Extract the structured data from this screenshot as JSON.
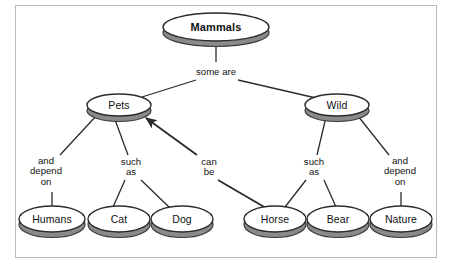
{
  "diagram": {
    "type": "concept-map",
    "colors": {
      "node_fill": "#ffffff",
      "node_stroke": "#2b2b2b",
      "node_shadow": "#8a8a8a",
      "edge_stroke": "#2b2b2b",
      "frame_border": "#b9b9b9",
      "background": "#ffffff"
    },
    "nodes": [
      {
        "id": "mammals",
        "label": "Mammals",
        "cx": 216,
        "cy": 27,
        "rx": 53,
        "ry": 14,
        "bold": true
      },
      {
        "id": "pets",
        "label": "Pets",
        "cx": 119,
        "cy": 105,
        "rx": 32,
        "ry": 11,
        "bold": false
      },
      {
        "id": "wild",
        "label": "Wild",
        "cx": 337,
        "cy": 105,
        "rx": 32,
        "ry": 11,
        "bold": false
      },
      {
        "id": "humans",
        "label": "Humans",
        "cx": 52,
        "cy": 219,
        "rx": 33,
        "ry": 13,
        "bold": false
      },
      {
        "id": "cat",
        "label": "Cat",
        "cx": 119,
        "cy": 219,
        "rx": 31,
        "ry": 13,
        "bold": false
      },
      {
        "id": "dog",
        "label": "Dog",
        "cx": 182,
        "cy": 219,
        "rx": 31,
        "ry": 13,
        "bold": false
      },
      {
        "id": "horse",
        "label": "Horse",
        "cx": 275,
        "cy": 219,
        "rx": 31,
        "ry": 13,
        "bold": false
      },
      {
        "id": "bear",
        "label": "Bear",
        "cx": 338,
        "cy": 219,
        "rx": 31,
        "ry": 13,
        "bold": false
      },
      {
        "id": "nature",
        "label": "Nature",
        "cx": 401,
        "cy": 219,
        "rx": 31,
        "ry": 13,
        "bold": false
      }
    ],
    "edge_labels": [
      {
        "id": "some-are",
        "text": "some are",
        "x": 216,
        "y": 72
      },
      {
        "id": "and-depend-on-l",
        "text": "and\ndepend\non",
        "x": 46,
        "y": 172
      },
      {
        "id": "such-as-left",
        "text": "such\nas",
        "x": 131,
        "y": 167
      },
      {
        "id": "can-be",
        "text": "can\nbe",
        "x": 209,
        "y": 167
      },
      {
        "id": "such-as-right",
        "text": "such\nas",
        "x": 314,
        "y": 167
      },
      {
        "id": "and-depend-on-r",
        "text": "and\ndepend\non",
        "x": 400,
        "y": 172
      }
    ],
    "edges": [
      {
        "id": "mammals-someare",
        "from": "mammals",
        "to": "some-are",
        "points": "216,41 216,62",
        "arrow": false,
        "thick": false
      },
      {
        "id": "someare-pets",
        "from": "some-are",
        "to": "pets",
        "points": "196,80 142,97",
        "arrow": false,
        "thick": false
      },
      {
        "id": "someare-wild",
        "from": "some-are",
        "to": "wild",
        "points": "238,80 316,98",
        "arrow": false,
        "thick": false
      },
      {
        "id": "pets-anddepend",
        "from": "pets",
        "to": "and-depend-on-l",
        "points": "97,115 60,155",
        "arrow": false,
        "thick": false
      },
      {
        "id": "anddepend-humans",
        "from": "and-depend-on-l",
        "to": "humans",
        "points": "52,192 52,206",
        "arrow": false,
        "thick": false
      },
      {
        "id": "pets-suchas",
        "from": "pets",
        "to": "such-as-left",
        "points": "114,117 128,155",
        "arrow": false,
        "thick": false
      },
      {
        "id": "suchas-cat",
        "from": "such-as-left",
        "to": "cat",
        "points": "125,180 113,207",
        "arrow": false,
        "thick": false
      },
      {
        "id": "suchas-dog",
        "from": "such-as-left",
        "to": "dog",
        "points": "141,180 170,208",
        "arrow": false,
        "thick": false
      },
      {
        "id": "canbe-pets",
        "from": "can-be",
        "to": "pets",
        "points": "197,155 146,118",
        "arrow": true,
        "thick": true
      },
      {
        "id": "canbe-horse",
        "from": "can-be",
        "to": "horse",
        "points": "218,180 266,208",
        "arrow": false,
        "thick": true
      },
      {
        "id": "wild-suchas",
        "from": "wild",
        "to": "such-as-right",
        "points": "326,117 317,155",
        "arrow": false,
        "thick": false
      },
      {
        "id": "suchasr-horse",
        "from": "such-as-right",
        "to": "horse",
        "points": "306,180 285,207",
        "arrow": false,
        "thick": false
      },
      {
        "id": "suchasr-bear",
        "from": "such-as-right",
        "to": "bear",
        "points": "324,180 336,207",
        "arrow": false,
        "thick": false
      },
      {
        "id": "wild-anddepend",
        "from": "wild",
        "to": "and-depend-on-r",
        "points": "358,116 389,155",
        "arrow": false,
        "thick": false
      },
      {
        "id": "anddependr-nature",
        "from": "and-depend-on-r",
        "to": "nature",
        "points": "401,192 401,206",
        "arrow": false,
        "thick": false
      }
    ]
  }
}
